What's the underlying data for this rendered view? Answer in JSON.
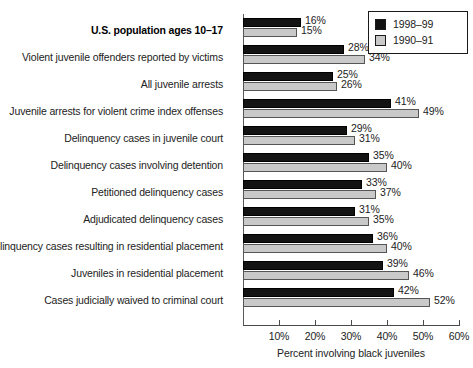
{
  "chart_data": {
    "type": "bar",
    "orientation": "horizontal",
    "title": "",
    "xlabel": "Percent involving black juveniles",
    "ylabel": "",
    "xlim": [
      0,
      60
    ],
    "grid": false,
    "legend_position": "top-right",
    "tick_labels": [
      "10%",
      "20%",
      "30%",
      "40%",
      "50%",
      "60%"
    ],
    "tick_values": [
      10,
      20,
      30,
      40,
      50,
      60
    ],
    "categories": [
      "U.S. population ages 10–17",
      "Violent juvenile offenders reported by victims",
      "All juvenile arrests",
      "Juvenile arrests for violent crime index offenses",
      "Delinquency cases in juvenile court",
      "Delinquency cases involving detention",
      "Petitioned delinquency cases",
      "Adjudicated delinquency cases",
      "Delinquency cases resulting in residential placement",
      "Juveniles in residential placement",
      "Cases judicially waived to criminal court"
    ],
    "emphasized_categories": [
      "U.S. population ages 10–17"
    ],
    "series": [
      {
        "name": "1998–99",
        "color": "#131313",
        "values": [
          16,
          28,
          25,
          41,
          29,
          35,
          33,
          31,
          36,
          39,
          42
        ],
        "labels": [
          "16%",
          "28%",
          "25%",
          "41%",
          "29%",
          "35%",
          "33%",
          "31%",
          "36%",
          "39%",
          "42%"
        ]
      },
      {
        "name": "1990–91",
        "color": "#c9c9c9",
        "values": [
          15,
          34,
          26,
          49,
          31,
          40,
          37,
          35,
          40,
          46,
          52
        ],
        "labels": [
          "15%",
          "34%",
          "26%",
          "49%",
          "31%",
          "40%",
          "37%",
          "35%",
          "40%",
          "46%",
          "52%"
        ]
      }
    ]
  },
  "legend": {
    "entries": [
      {
        "label": "1998–99",
        "swatch": "dark"
      },
      {
        "label": "1990–91",
        "swatch": "light"
      }
    ]
  }
}
